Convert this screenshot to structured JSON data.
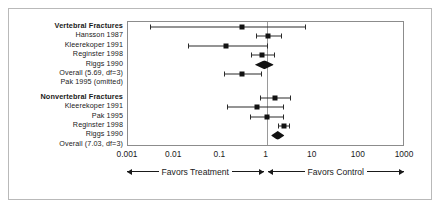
{
  "chart_data": {
    "type": "forest",
    "title": "",
    "xlabel": "",
    "ylabel": "",
    "xscale": "log",
    "xlim": [
      0.001,
      1000
    ],
    "ticks": [
      "0.001",
      "0.01",
      "0.1",
      "1",
      "10",
      "100",
      "1000"
    ],
    "tick_values": [
      0.001,
      0.01,
      0.1,
      1,
      10,
      100,
      1000
    ],
    "reference_line": 1,
    "grid": false,
    "axis_direction_labels": {
      "left": "Favors Treatment",
      "right": "Favors Control"
    },
    "groups": [
      {
        "label": "Vertebral Fractures",
        "rows": [
          {
            "label": "Hansson 1987",
            "estimate": 0.3,
            "ci_low": 0.003,
            "ci_high": 7.0,
            "kind": "study"
          },
          {
            "label": "Kleerekoper 1991",
            "estimate": 1.1,
            "ci_low": 0.6,
            "ci_high": 2.2,
            "kind": "study"
          },
          {
            "label": "Reginster 1998",
            "estimate": 0.13,
            "ci_low": 0.02,
            "ci_high": 1.1,
            "kind": "study"
          },
          {
            "label": "Riggs 1990",
            "estimate": 0.78,
            "ci_low": 0.46,
            "ci_high": 1.5,
            "kind": "study"
          },
          {
            "label": "Overall (5.69, df=3)",
            "estimate": 0.8,
            "ci_low": 0.56,
            "ci_high": 1.45,
            "kind": "overall"
          },
          {
            "label": "Pak 1995 (omitted)",
            "estimate": 0.3,
            "ci_low": 0.12,
            "ci_high": 0.78,
            "kind": "study"
          }
        ]
      },
      {
        "label": "Nonvertebral Fractures",
        "rows": [
          {
            "label": "Kleerekoper 1991",
            "estimate": 1.55,
            "ci_low": 0.72,
            "ci_high": 3.4,
            "kind": "study"
          },
          {
            "label": "Pak 1995",
            "estimate": 0.62,
            "ci_low": 0.14,
            "ci_high": 2.4,
            "kind": "study"
          },
          {
            "label": "Reginster 1998",
            "estimate": 1.05,
            "ci_low": 0.45,
            "ci_high": 2.4,
            "kind": "study"
          },
          {
            "label": "Riggs 1990",
            "estimate": 2.4,
            "ci_low": 1.75,
            "ci_high": 3.3,
            "kind": "study"
          },
          {
            "label": "Overall (7.03, df=3)",
            "estimate": 1.7,
            "ci_low": 1.25,
            "ci_high": 2.45,
            "kind": "overall"
          }
        ]
      }
    ]
  }
}
